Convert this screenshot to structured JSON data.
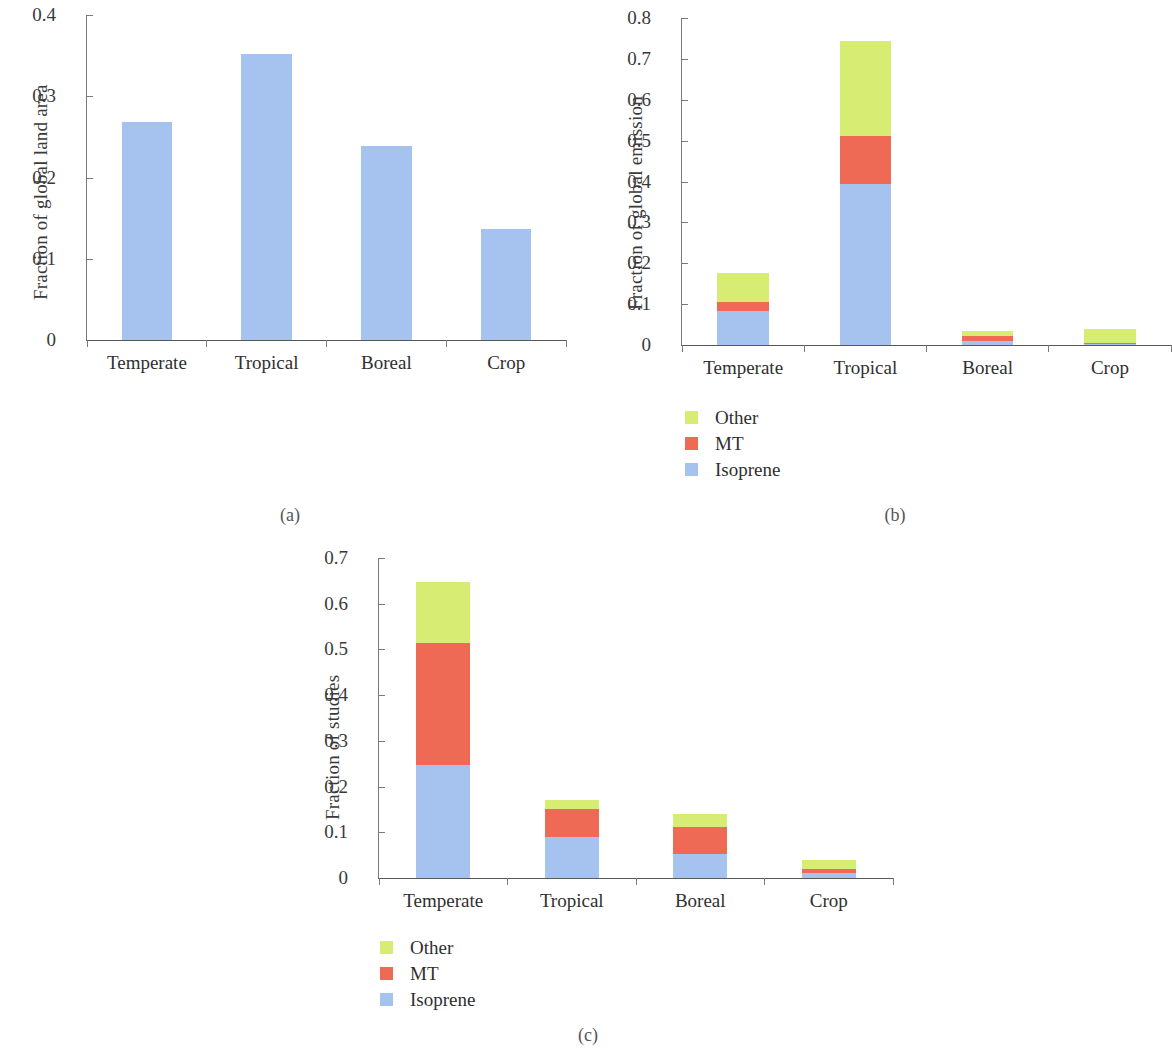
{
  "figure": {
    "captions": {
      "a": "(a)",
      "b": "(b)",
      "c": "(c)"
    }
  },
  "legend": {
    "items": [
      {
        "label": "Other",
        "color": "#d6ec73"
      },
      {
        "label": "MT",
        "color": "#ef6a55"
      },
      {
        "label": "Isoprene",
        "color": "#a6c3ef"
      }
    ]
  },
  "colors": {
    "other": "#d6ec73",
    "mt": "#ef6a55",
    "isoprene": "#a6c3ef",
    "single_bar": "#a6c3ef",
    "axis": "#7a7a7a",
    "text": "#2f2f2f"
  },
  "chart_data": [
    {
      "id": "a",
      "type": "bar",
      "title": "",
      "xlabel": "",
      "ylabel": "Fraction of global land area",
      "categories": [
        "Temperate",
        "Tropical",
        "Boreal",
        "Crop"
      ],
      "ylim": [
        0,
        0.4
      ],
      "yticks": [
        "0",
        "0.1",
        "0.2",
        "0.3",
        "0.4"
      ],
      "ytick_values": [
        0,
        0.1,
        0.2,
        0.3,
        0.4
      ],
      "grid": false,
      "legend_position": "none",
      "series": [
        {
          "name": "Fraction of global land area",
          "color": "#a6c3ef",
          "values": [
            0.268,
            0.352,
            0.239,
            0.137
          ]
        }
      ]
    },
    {
      "id": "b",
      "type": "bar",
      "title": "",
      "xlabel": "",
      "ylabel": "Fraction of global emission",
      "categories": [
        "Temperate",
        "Tropical",
        "Boreal",
        "Crop"
      ],
      "ylim": [
        0,
        0.8
      ],
      "yticks": [
        "0",
        "0.1",
        "0.2",
        "0.3",
        "0.4",
        "0.5",
        "0.6",
        "0.7",
        "0.8"
      ],
      "ytick_values": [
        0,
        0.1,
        0.2,
        0.3,
        0.4,
        0.5,
        0.6,
        0.7,
        0.8
      ],
      "grid": false,
      "stacked": true,
      "legend_position": "below-left",
      "series": [
        {
          "name": "Isoprene",
          "color": "#a6c3ef",
          "values": [
            0.083,
            0.394,
            0.011,
            0.002
          ]
        },
        {
          "name": "MT",
          "color": "#ef6a55",
          "values": [
            0.023,
            0.118,
            0.01,
            0.003
          ]
        },
        {
          "name": "Other",
          "color": "#d6ec73",
          "values": [
            0.07,
            0.231,
            0.014,
            0.034
          ]
        }
      ]
    },
    {
      "id": "c",
      "type": "bar",
      "title": "",
      "xlabel": "",
      "ylabel": "Fraction of studies",
      "categories": [
        "Temperate",
        "Tropical",
        "Boreal",
        "Crop"
      ],
      "ylim": [
        0,
        0.7
      ],
      "yticks": [
        "0",
        "0.1",
        "0.2",
        "0.3",
        "0.4",
        "0.5",
        "0.6",
        "0.7"
      ],
      "ytick_values": [
        0,
        0.1,
        0.2,
        0.3,
        0.4,
        0.5,
        0.6,
        0.7
      ],
      "grid": false,
      "stacked": true,
      "legend_position": "below-left",
      "series": [
        {
          "name": "Isoprene",
          "color": "#a6c3ef",
          "values": [
            0.248,
            0.09,
            0.052,
            0.012
          ]
        },
        {
          "name": "MT",
          "color": "#ef6a55",
          "values": [
            0.267,
            0.061,
            0.059,
            0.008
          ]
        },
        {
          "name": "Other",
          "color": "#d6ec73",
          "values": [
            0.133,
            0.019,
            0.028,
            0.02
          ]
        }
      ]
    }
  ]
}
